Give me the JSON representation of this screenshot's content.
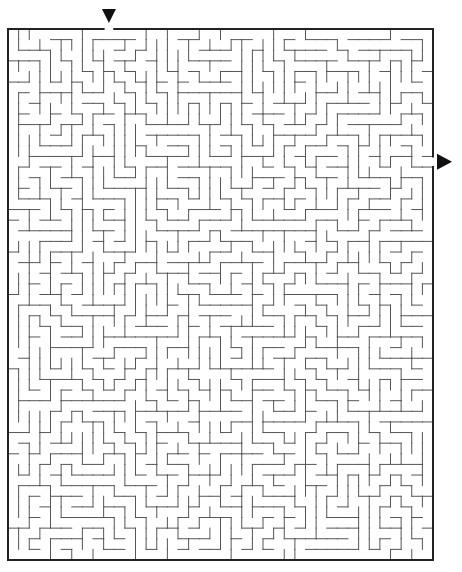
{
  "maze": {
    "cols": 40,
    "rows": 50,
    "left": 8,
    "top": 29,
    "right": 433,
    "bottom": 560,
    "wall_color": "#555555",
    "border_color": "#222222",
    "seed": 7331
  },
  "entrance": {
    "label": "start-arrow",
    "col": 9,
    "side": "top",
    "icon": "▼"
  },
  "exit": {
    "label": "finish-arrow",
    "row": 12,
    "side": "right",
    "icon": "▶"
  }
}
